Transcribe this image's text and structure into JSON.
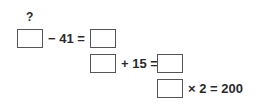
{
  "puzzle": {
    "unknown_marker": "?",
    "rows": [
      {
        "operation": "− 41 ="
      },
      {
        "operation": "+ 15 ="
      },
      {
        "operation": "× 2 = 200"
      }
    ]
  }
}
